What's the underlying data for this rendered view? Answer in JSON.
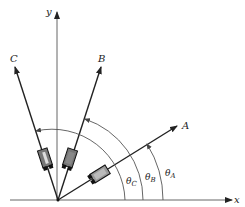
{
  "diagram": {
    "origin": {
      "x": 58,
      "y": 200
    },
    "axes": {
      "x": {
        "label": "x"
      },
      "y": {
        "label": "y"
      }
    },
    "gauges": [
      {
        "id": "A",
        "label": "A",
        "angle_label": "θ",
        "angle_sub": "A",
        "angle_deg": 32
      },
      {
        "id": "B",
        "label": "B",
        "angle_label": "θ",
        "angle_sub": "B",
        "angle_deg": 72
      },
      {
        "id": "C",
        "label": "C",
        "angle_label": "θ",
        "angle_sub": "C",
        "angle_deg": 108
      }
    ],
    "colors": {
      "line": "#222222",
      "arc": "#555555",
      "gauge_fill": "#888888",
      "gauge_dark": "#111111"
    }
  }
}
